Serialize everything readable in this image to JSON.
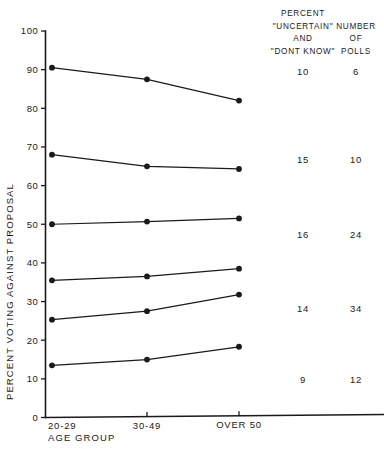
{
  "chart_data": {
    "type": "line",
    "title": "",
    "xlabel": "AGE  GROUP",
    "ylabel": "PERCENT   VOTING   AGAINST   PROPOSAL",
    "categories": [
      "20-29",
      "30-49",
      "OVER 50"
    ],
    "ylim": [
      0,
      100
    ],
    "yticks": [
      0,
      10,
      20,
      30,
      40,
      50,
      60,
      70,
      80,
      90,
      100
    ],
    "ytick_labels": [
      "0",
      "10",
      "20",
      "30",
      "40",
      "50",
      "60",
      "70",
      "80",
      "90",
      "100"
    ],
    "grid": false,
    "legend": "none",
    "series": [
      {
        "name": "poll-group-1",
        "values": [
          90.5,
          87.5,
          82.0
        ]
      },
      {
        "name": "poll-group-2",
        "values": [
          68.0,
          65.0,
          64.3
        ]
      },
      {
        "name": "poll-group-3",
        "values": [
          50.0,
          50.7,
          51.5
        ]
      },
      {
        "name": "poll-group-4",
        "values": [
          35.5,
          36.5,
          38.5
        ]
      },
      {
        "name": "poll-group-5",
        "values": [
          25.3,
          27.5,
          31.8
        ]
      },
      {
        "name": "poll-group-6",
        "values": [
          13.5,
          15.0,
          18.3
        ]
      }
    ]
  },
  "annotation_columns": {
    "uncertain": {
      "header_lines": [
        "PERCENT",
        "\"UNCERTAIN\"",
        "AND",
        "\"DONT KNOW\""
      ],
      "values": [
        "10",
        "15",
        "16",
        "14",
        "9"
      ]
    },
    "polls": {
      "header_lines": [
        "NUMBER",
        "OF",
        "POLLS"
      ],
      "values": [
        "6",
        "10",
        "24",
        "34",
        "12"
      ]
    }
  },
  "colors": {
    "ink": "#1a1a1a",
    "background": "#ffffff"
  }
}
